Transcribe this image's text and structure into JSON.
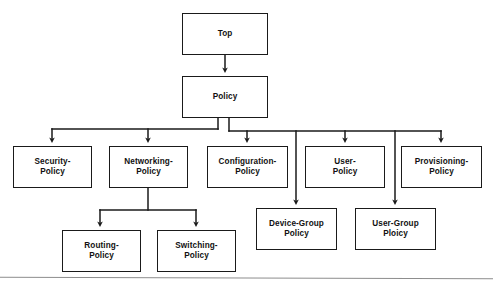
{
  "diagram": {
    "type": "tree",
    "background_color": "#ffffff",
    "line_color": "#1a1a1a",
    "text_color": "#111111",
    "nodes": [
      {
        "id": "top",
        "label": "Top",
        "level": 0,
        "x": 182,
        "y": 13,
        "w": 86,
        "h": 42
      },
      {
        "id": "policy",
        "label": "Policy",
        "level": 1,
        "x": 182,
        "y": 76,
        "w": 86,
        "h": 42
      },
      {
        "id": "security-policy",
        "label": "Security-\nPolicy",
        "level": 2,
        "x": 13,
        "y": 146,
        "w": 79,
        "h": 42
      },
      {
        "id": "networking-policy",
        "label": "Networking-\nPolicy",
        "level": 2,
        "x": 109,
        "y": 146,
        "w": 79,
        "h": 42
      },
      {
        "id": "configuration-policy",
        "label": "Configuration-\nPolicy",
        "level": 2,
        "x": 207,
        "y": 146,
        "w": 81,
        "h": 42
      },
      {
        "id": "user-policy",
        "label": "User-\nPolicy",
        "level": 2,
        "x": 305,
        "y": 146,
        "w": 80,
        "h": 42
      },
      {
        "id": "provisioning-policy",
        "label": "Provisioning-\nPolicy",
        "level": 2,
        "x": 401,
        "y": 146,
        "w": 81,
        "h": 42
      },
      {
        "id": "device-group-policy",
        "label": "Device-Group\nPolicy",
        "level": 3,
        "x": 256,
        "y": 208,
        "w": 81,
        "h": 42
      },
      {
        "id": "user-group-policy",
        "label": "User-Group\nPloicy",
        "level": 3,
        "x": 355,
        "y": 208,
        "w": 81,
        "h": 42
      },
      {
        "id": "routing-policy",
        "label": "Routing-\nPolicy",
        "level": 3,
        "x": 62,
        "y": 230,
        "w": 79,
        "h": 42
      },
      {
        "id": "switching-policy",
        "label": "Switching-\nPolicy",
        "level": 3,
        "x": 157,
        "y": 230,
        "w": 79,
        "h": 42
      }
    ],
    "edges": [
      {
        "from": "top",
        "to": "policy"
      },
      {
        "from": "policy",
        "to": "security-policy"
      },
      {
        "from": "policy",
        "to": "networking-policy"
      },
      {
        "from": "policy",
        "to": "configuration-policy"
      },
      {
        "from": "policy",
        "to": "user-policy"
      },
      {
        "from": "policy",
        "to": "provisioning-policy"
      },
      {
        "from": "policy",
        "to": "device-group-policy"
      },
      {
        "from": "policy",
        "to": "user-group-policy"
      },
      {
        "from": "networking-policy",
        "to": "routing-policy"
      },
      {
        "from": "networking-policy",
        "to": "switching-policy"
      }
    ]
  }
}
